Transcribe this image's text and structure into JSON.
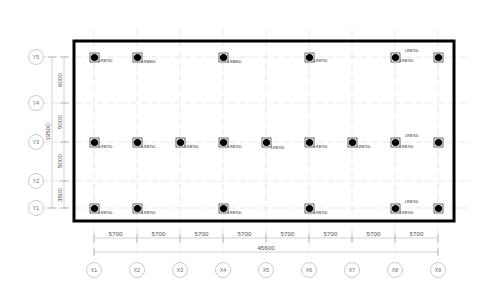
{
  "drawing": {
    "type": "structural-isolator-layout-plan",
    "title": "",
    "units": "mm"
  },
  "grid": {
    "x_axis": {
      "labels": [
        "X1",
        "X2",
        "X3",
        "X4",
        "X5",
        "X6",
        "X7",
        "X8",
        "X9"
      ],
      "spacings": [
        "5700",
        "5700",
        "5700",
        "5700",
        "5700",
        "5700",
        "5700",
        "5700"
      ],
      "total": "45600"
    },
    "y_axis": {
      "labels": [
        "Y5",
        "Y4",
        "Y3",
        "Y2",
        "Y1"
      ],
      "spacings": [
        "6000",
        "5000",
        "5000",
        "3500"
      ],
      "total": "19500"
    }
  },
  "bearings": {
    "rows": [
      {
        "grid_y": "Y5",
        "items": [
          {
            "grid_x": "X1",
            "label": "LRB750"
          },
          {
            "grid_x": "X2",
            "label": "LRB800"
          },
          {
            "grid_x": "X4",
            "label": "LRB800"
          },
          {
            "grid_x": "X6",
            "label": "LRB750"
          },
          {
            "grid_x": "X8",
            "label": "LRB700"
          },
          {
            "grid_x": "X9",
            "label": "LRB700"
          }
        ]
      },
      {
        "grid_y": "Y3",
        "items": [
          {
            "grid_x": "X1",
            "label": "LRB750"
          },
          {
            "grid_x": "X2",
            "label": "LRB750"
          },
          {
            "grid_x": "X3",
            "label": "LRB700"
          },
          {
            "grid_x": "X4",
            "label": "LRB700"
          },
          {
            "grid_x": "X5",
            "label": "LRB750"
          },
          {
            "grid_x": "X6",
            "label": "LRB700"
          },
          {
            "grid_x": "X7",
            "label": "LRB700"
          },
          {
            "grid_x": "X8",
            "label": "LRB700"
          },
          {
            "grid_x": "X9",
            "label": "LRB700"
          }
        ]
      },
      {
        "grid_y": "Y1",
        "items": [
          {
            "grid_x": "X1",
            "label": "LRB700"
          },
          {
            "grid_x": "X2",
            "label": "LRB700"
          },
          {
            "grid_x": "X4",
            "label": "LRB700"
          },
          {
            "grid_x": "X6",
            "label": "LRB700"
          },
          {
            "grid_x": "X8",
            "label": "LRB700"
          },
          {
            "grid_x": "X9",
            "label": "LRB700"
          }
        ]
      }
    ]
  },
  "colors": {
    "outline": "#000000",
    "gridline": "#c9c9c9",
    "dimension": "#9a9a9a",
    "bubble_stroke": "#b5b5b5",
    "bubble_text": "#6a6a6a",
    "label_text": "#1a1a1a"
  },
  "labels": {
    "x_spacing_0": "5700",
    "x_spacing_1": "5700",
    "x_spacing_2": "5700",
    "x_spacing_3": "5700",
    "x_spacing_4": "5700",
    "x_spacing_5": "5700",
    "x_spacing_6": "5700",
    "x_spacing_7": "5700",
    "x_total": "45600",
    "y_spacing_0": "6000",
    "y_spacing_1": "5000",
    "y_spacing_2": "5000",
    "y_spacing_3": "3500",
    "y_total": "19500",
    "bubble_x1": "X1",
    "bubble_x2": "X2",
    "bubble_x3": "X3",
    "bubble_x4": "X4",
    "bubble_x5": "X5",
    "bubble_x6": "X6",
    "bubble_x7": "X7",
    "bubble_x8": "X8",
    "bubble_x9": "X9",
    "bubble_y1": "Y1",
    "bubble_y2": "Y2",
    "bubble_y3": "Y3",
    "bubble_y4": "Y4",
    "bubble_y5": "Y5"
  }
}
